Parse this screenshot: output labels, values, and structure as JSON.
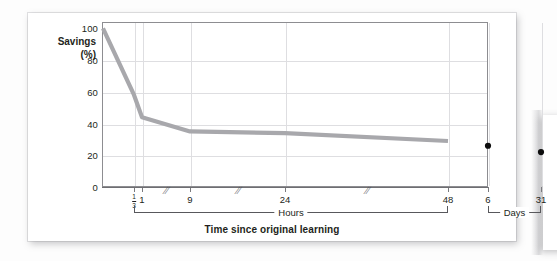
{
  "figure": {
    "chart_type": "line",
    "y_axis": {
      "title_line1": "Savings",
      "title_line2": "(%)",
      "ticks": [
        "100",
        "80",
        "60",
        "40",
        "20",
        "0"
      ],
      "min": 0,
      "max": 104
    },
    "x_axis": {
      "title": "Time since original learning",
      "hours_labels": [
        "1/3",
        "1",
        "9",
        "24",
        "48"
      ],
      "days_labels": [
        "6",
        "31"
      ],
      "group_hours_label": "Hours",
      "group_days_label": "Days",
      "break_marker": "//"
    },
    "colors": {
      "curve": "#a8a8ac",
      "dot": "#0d0d0d",
      "frame": "#8d8d91",
      "grid": "#dedee1",
      "text": "#231f20",
      "card": "#ffffff"
    }
  },
  "chart_data": {
    "type": "line",
    "title": "",
    "subtitle": "",
    "xlabel": "Time since original learning",
    "ylabel": "Savings (%)",
    "ylim": [
      0,
      104
    ],
    "grid": true,
    "legend": "none",
    "x_tick_labels": [
      "1/3",
      "1",
      "9",
      "24",
      "48",
      "6",
      "31"
    ],
    "x_tick_units": [
      "Hours",
      "Hours",
      "Hours",
      "Hours",
      "Hours",
      "Days",
      "Days"
    ],
    "y_tick_labels": [
      "0",
      "20",
      "40",
      "60",
      "80",
      "100"
    ],
    "series": [
      {
        "name": "Retention curve (savings)",
        "style": "line",
        "points": [
          {
            "label": "0",
            "unit": "Hours",
            "x_px": 1,
            "value": 100
          },
          {
            "label": "1/3",
            "unit": "Hours",
            "x_px": 32,
            "value": 58
          },
          {
            "label": "1",
            "unit": "Hours",
            "x_px": 40,
            "value": 44
          },
          {
            "label": "9",
            "unit": "Hours",
            "x_px": 88,
            "value": 35
          },
          {
            "label": "24",
            "unit": "Hours",
            "x_px": 183,
            "value": 34
          },
          {
            "label": "48",
            "unit": "Hours",
            "x_px": 346,
            "value": 29
          }
        ]
      },
      {
        "name": "Long interval measurements",
        "style": "scatter",
        "points": [
          {
            "label": "6",
            "unit": "Days",
            "x_px": 386,
            "value": 26
          },
          {
            "label": "31",
            "unit": "Days",
            "x_px": 439,
            "value": 22
          }
        ]
      }
    ],
    "annotations": [
      {
        "text": "//",
        "meaning": "axis break",
        "after_label": "1"
      },
      {
        "text": "//",
        "meaning": "axis break",
        "after_label": "9"
      },
      {
        "text": "//",
        "meaning": "axis break",
        "after_label": "24"
      }
    ]
  }
}
